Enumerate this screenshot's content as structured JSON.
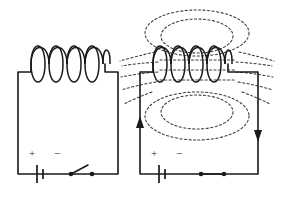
{
  "figure": {
    "background_color": "#ffffff",
    "line_color": "#1a1a1a",
    "field_line_color": "#3a3a3a",
    "width": 281,
    "height": 198
  },
  "panels": [
    {
      "id": "left",
      "name": "open-switch-circuit",
      "switch_state": "open",
      "field_present": false,
      "battery": {
        "plus_label": "+",
        "minus_label": "−"
      },
      "coil_turns": 5,
      "current_flowing": false,
      "current_arrows": []
    },
    {
      "id": "right",
      "name": "closed-switch-circuit",
      "switch_state": "closed",
      "field_present": true,
      "battery": {
        "plus_label": "+",
        "minus_label": "−"
      },
      "coil_turns": 5,
      "current_flowing": true,
      "current_arrows": [
        {
          "side": "left",
          "direction": "up"
        },
        {
          "side": "right",
          "direction": "down"
        }
      ],
      "field_lines": {
        "closed_loops_above": 2,
        "closed_loops_below": 2,
        "radiating_lines_left": 5,
        "radiating_lines_right": 5,
        "through_coil_lines": 3,
        "style": "dashed"
      }
    }
  ]
}
